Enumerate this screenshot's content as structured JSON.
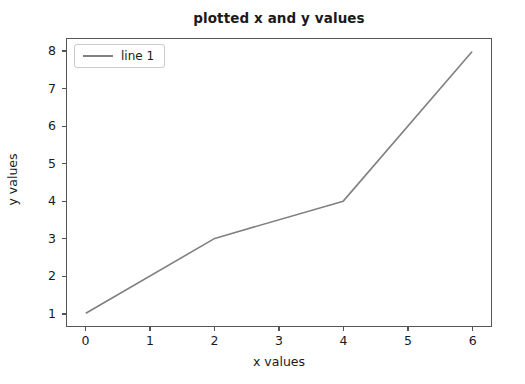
{
  "chart_data": {
    "type": "line",
    "title": "plotted x and y values",
    "xlabel": "x values",
    "ylabel": "y values",
    "x": [
      0,
      2,
      4,
      6
    ],
    "series": [
      {
        "name": "line 1",
        "values": [
          1,
          3,
          4,
          8
        ],
        "color": "#808080"
      }
    ],
    "xticks": [
      "0",
      "1",
      "2",
      "3",
      "4",
      "5",
      "6"
    ],
    "xtick_values": [
      0,
      1,
      2,
      3,
      4,
      5,
      6
    ],
    "yticks": [
      "1",
      "2",
      "3",
      "4",
      "5",
      "6",
      "7",
      "8"
    ],
    "ytick_values": [
      1,
      2,
      3,
      4,
      5,
      6,
      7,
      8
    ],
    "xlim": [
      -0.3,
      6.3
    ],
    "ylim": [
      0.65,
      8.35
    ],
    "grid": false,
    "legend": {
      "position": "upper-left",
      "entries": [
        "line 1"
      ]
    },
    "colors": {
      "line": "#808080",
      "axis": "#555555",
      "text": "#1a1a1a",
      "background": "#ffffff",
      "legend_border": "#cccccc"
    }
  }
}
